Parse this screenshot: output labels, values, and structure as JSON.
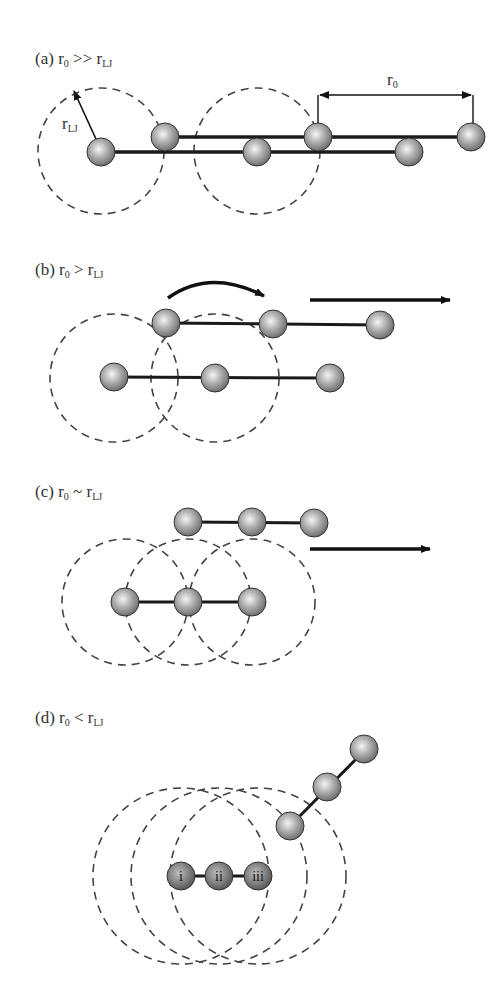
{
  "figure": {
    "panels": [
      {
        "id": "a",
        "tag": "(a)",
        "r": "r",
        "r_sub": "0",
        "relation": ">>",
        "rlj": "r",
        "rlj_sub": "LJ",
        "annotations": {
          "radius_label": "r",
          "radius_sub": "LJ",
          "distance_label": "r",
          "distance_sub": "0"
        }
      },
      {
        "id": "b",
        "tag": "(b)",
        "r": "r",
        "r_sub": "0",
        "relation": ">",
        "rlj": "r",
        "rlj_sub": "LJ"
      },
      {
        "id": "c",
        "tag": "(c)",
        "r": "r",
        "r_sub": "0",
        "relation": "~",
        "rlj": "r",
        "rlj_sub": "LJ"
      },
      {
        "id": "d",
        "tag": "(d)",
        "r": "r",
        "r_sub": "0",
        "relation": "<",
        "rlj": "r",
        "rlj_sub": "LJ",
        "atom_labels": [
          "i",
          "ii",
          "iii"
        ]
      }
    ],
    "colors": {
      "sphere_light": "#f4f4f4",
      "sphere_mid": "#a8a8a8",
      "sphere_dark": "#6a6a6a",
      "line": "#1a1a1a",
      "dash": "#444444",
      "text": "#333333"
    }
  }
}
